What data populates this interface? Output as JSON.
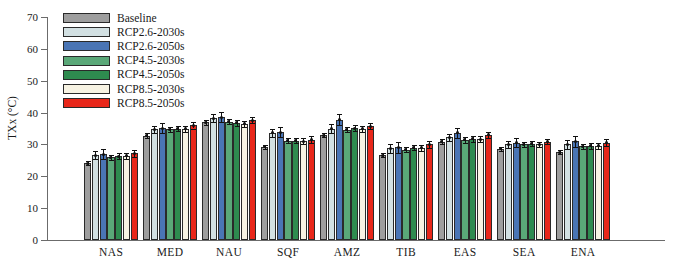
{
  "chart_data": {
    "type": "bar",
    "title": "",
    "xlabel": "",
    "ylabel": "TXx (°C)",
    "ylim": [
      0,
      70
    ],
    "yticks": [
      0,
      10,
      20,
      30,
      40,
      50,
      60,
      70
    ],
    "grid": false,
    "legend_position": "top-left",
    "categories": [
      "NAS",
      "MED",
      "NAU",
      "SQF",
      "AMZ",
      "TIB",
      "EAS",
      "SEA",
      "ENA"
    ],
    "series": [
      {
        "name": "Baseline",
        "color": "#9e9e9e",
        "values": [
          24.1,
          32.8,
          37.0,
          29.2,
          32.9,
          26.6,
          30.9,
          28.6,
          27.6
        ],
        "errors": [
          0.6,
          0.7,
          0.8,
          0.6,
          0.7,
          0.6,
          0.7,
          0.6,
          0.6
        ]
      },
      {
        "name": "RCP2.6-2030s",
        "color": "#d2e0e2",
        "values": [
          26.6,
          34.8,
          38.2,
          33.6,
          35.0,
          28.8,
          32.2,
          30.1,
          30.0
        ],
        "errors": [
          1.3,
          1.1,
          1.3,
          1.3,
          1.3,
          1.4,
          1.2,
          1.1,
          1.3
        ]
      },
      {
        "name": "RCP2.6-2050s",
        "color": "#4a75b5",
        "values": [
          26.9,
          35.1,
          38.5,
          33.9,
          37.8,
          29.1,
          33.6,
          30.6,
          31.0
        ],
        "errors": [
          1.6,
          1.5,
          1.6,
          1.6,
          1.7,
          1.7,
          1.5,
          1.4,
          1.7
        ]
      },
      {
        "name": "RCP4.5-2030s",
        "color": "#5aa878",
        "values": [
          26.0,
          34.7,
          37.1,
          31.1,
          34.6,
          28.4,
          31.4,
          30.0,
          29.4
        ],
        "errors": [
          0.8,
          0.8,
          0.8,
          0.8,
          0.8,
          0.8,
          0.8,
          0.7,
          0.8
        ]
      },
      {
        "name": "RCP4.5-2050s",
        "color": "#2e8b4f",
        "values": [
          26.3,
          35.0,
          36.8,
          31.2,
          35.1,
          29.0,
          31.8,
          30.2,
          29.6
        ],
        "errors": [
          0.9,
          0.9,
          0.9,
          0.9,
          0.9,
          0.9,
          0.9,
          0.8,
          0.9
        ]
      },
      {
        "name": "RCP8.5-2030s",
        "color": "#f7f3e3",
        "values": [
          26.4,
          34.9,
          36.5,
          31.0,
          34.9,
          28.9,
          31.6,
          30.0,
          29.6
        ],
        "errors": [
          0.9,
          0.9,
          0.9,
          0.9,
          0.9,
          0.9,
          0.9,
          0.8,
          0.9
        ]
      },
      {
        "name": "RCP8.5-2050s",
        "color": "#e8271a",
        "values": [
          27.2,
          36.0,
          37.6,
          31.5,
          35.7,
          30.0,
          33.0,
          30.9,
          30.6
        ],
        "errors": [
          1.0,
          1.0,
          1.0,
          1.0,
          1.0,
          1.0,
          1.0,
          0.9,
          1.0
        ]
      }
    ]
  },
  "legend": {
    "items": [
      {
        "label": "Baseline"
      },
      {
        "label": "RCP2.6-2030s"
      },
      {
        "label": "RCP2.6-2050s"
      },
      {
        "label": "RCP4.5-2030s"
      },
      {
        "label": "RCP4.5-2050s"
      },
      {
        "label": "RCP8.5-2030s"
      },
      {
        "label": "RCP8.5-2050s"
      }
    ]
  }
}
